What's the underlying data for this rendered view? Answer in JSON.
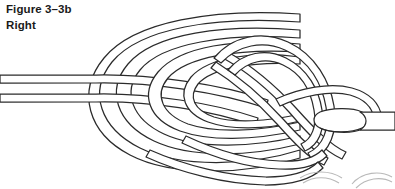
{
  "figure": {
    "number": "Figure 3–3b",
    "label_top": "Right",
    "label_bottom": "Left"
  },
  "colors": {
    "background": "#ffffff",
    "rope_outline": "#2b2b2b",
    "rope_fill": "#ffffff",
    "text": "#1a1a1a",
    "ghost_artifact": "#b9b9b9"
  },
  "diagram": {
    "type": "knot-tying-illustration",
    "name": "doubled-figure-eight-knot",
    "strand_count": 2,
    "entry_side": "left",
    "exit_side": "right",
    "end_type": "flat-cut-end"
  }
}
